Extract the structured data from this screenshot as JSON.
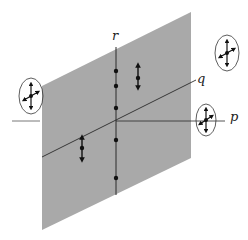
{
  "diagram": {
    "colors": {
      "background": "#ffffff",
      "plane": "#a9a9a9",
      "line": "#2a2a2a",
      "dot": "#111111"
    },
    "axes": {
      "r": {
        "label": "r"
      },
      "q": {
        "label": "q"
      },
      "p": {
        "label": "p"
      }
    },
    "plane": {
      "corners": [
        [
          42,
          86
        ],
        [
          191,
          12
        ],
        [
          191,
          158
        ],
        [
          42,
          230
        ]
      ]
    },
    "r_axis": {
      "x": 116,
      "y1": 47,
      "y2": 195,
      "dots_y": [
        71,
        86,
        108,
        140,
        178
      ]
    },
    "q_line": {
      "x1": 42,
      "y1": 157,
      "x2": 196,
      "y2": 80
    },
    "p_line": {
      "inner": [
        116,
        121,
        225,
        121
      ],
      "outer": [
        12,
        121,
        40,
        121
      ]
    },
    "double_arrows": [
      {
        "name": "left-double-arrow",
        "x": 82,
        "y1": 135,
        "y2": 162,
        "dot_y": 148
      },
      {
        "name": "upper-double-arrow",
        "x": 138,
        "y1": 63,
        "y2": 90,
        "dot_y": 78
      }
    ],
    "ellipses": [
      {
        "name": "ellipse-left",
        "cx": 31,
        "cy": 96,
        "rx": 12,
        "ry": 18
      },
      {
        "name": "ellipse-top-right",
        "cx": 227,
        "cy": 53,
        "rx": 12,
        "ry": 18
      },
      {
        "name": "ellipse-p",
        "cx": 206,
        "cy": 120,
        "rx": 10,
        "ry": 16
      }
    ]
  }
}
